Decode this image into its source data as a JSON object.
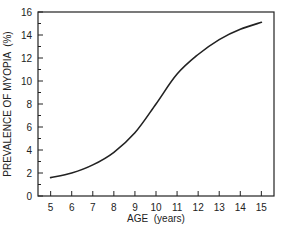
{
  "chart_data": {
    "type": "line",
    "title": "",
    "xlabel": "AGE  (years)",
    "ylabel": "PREVALENCE OF MYOPIA  (%)",
    "x": [
      5,
      6,
      7,
      8,
      9,
      10,
      11,
      12,
      13,
      14,
      15
    ],
    "series": [
      {
        "name": "Prevalence of myopia",
        "values": [
          1.6,
          2.0,
          2.7,
          3.8,
          5.5,
          8.0,
          10.6,
          12.3,
          13.6,
          14.5,
          15.1
        ]
      }
    ],
    "xlim": [
      4.4,
      15.6
    ],
    "ylim": [
      0,
      16
    ],
    "xticks": [
      5,
      6,
      7,
      8,
      9,
      10,
      11,
      12,
      13,
      14,
      15
    ],
    "yticks": [
      0,
      2,
      4,
      6,
      8,
      10,
      12,
      14,
      16
    ],
    "grid": false,
    "legend": "none",
    "line_color": "#222222"
  }
}
